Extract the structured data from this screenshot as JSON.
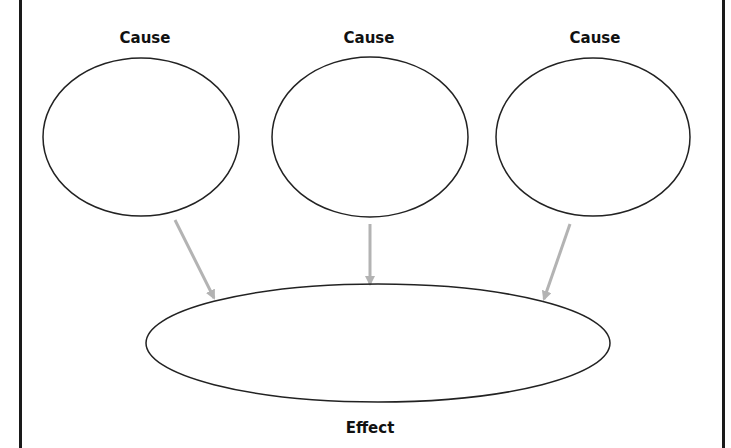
{
  "diagram": {
    "type": "cause-and-effect organizer",
    "causes": [
      {
        "label": "Cause",
        "cx": 141,
        "cy": 137,
        "rx": 98,
        "ry": 79,
        "label_x": 145,
        "label_y": 29
      },
      {
        "label": "Cause",
        "cx": 370,
        "cy": 137,
        "rx": 98,
        "ry": 80,
        "label_x": 369,
        "label_y": 29
      },
      {
        "label": "Cause",
        "cx": 593,
        "cy": 137,
        "rx": 97,
        "ry": 79,
        "label_x": 595,
        "label_y": 29
      }
    ],
    "effect": {
      "label": "Effect",
      "cx": 378,
      "cy": 343,
      "rx": 232,
      "ry": 59,
      "label_x": 370,
      "label_y": 419
    },
    "arrows": [
      {
        "from": "cause-1",
        "to": "effect",
        "x1": 175,
        "y1": 220,
        "x2": 214,
        "y2": 298
      },
      {
        "from": "cause-2",
        "to": "effect",
        "x1": 370,
        "y1": 224,
        "x2": 370,
        "y2": 284
      },
      {
        "from": "cause-3",
        "to": "effect",
        "x1": 570,
        "y1": 224,
        "x2": 544,
        "y2": 299
      }
    ],
    "colors": {
      "outline": "#222222",
      "arrow": "#b3b3b3",
      "border": "#1a1a1a",
      "background": "#ffffff"
    }
  }
}
